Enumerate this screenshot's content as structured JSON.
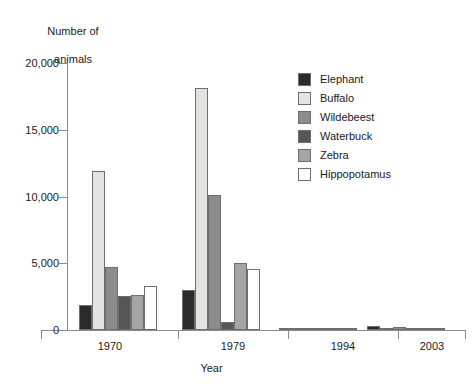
{
  "chart_data": {
    "type": "bar",
    "title": "",
    "ylabel": "Number of\nanimals",
    "xlabel": "Year",
    "categories": [
      "1970",
      "1979",
      "1994",
      "2003"
    ],
    "ylim": [
      0,
      20000
    ],
    "yticks": [
      0,
      5000,
      10000,
      15000,
      20000
    ],
    "ytick_labels": [
      "0",
      "5,000",
      "10,000",
      "15,000",
      "20,000"
    ],
    "grid": false,
    "legend_position": "right-top",
    "series": [
      {
        "name": "Elephant",
        "color": "#2b2b2b",
        "values": [
          1900,
          3000,
          120,
          280
        ]
      },
      {
        "name": "Buffalo",
        "color": "#e3e3e1",
        "values": [
          11900,
          18100,
          60,
          90
        ]
      },
      {
        "name": "Wildebeest",
        "color": "#8c8c8c",
        "values": [
          4700,
          10100,
          150,
          260
        ]
      },
      {
        "name": "Waterbuck",
        "color": "#565656",
        "values": [
          2550,
          620,
          40,
          110
        ]
      },
      {
        "name": "Zebra",
        "color": "#a5a5a5",
        "values": [
          2600,
          5000,
          80,
          180
        ]
      },
      {
        "name": "Hippopotamus",
        "color": "#ffffff",
        "values": [
          3300,
          4550,
          50,
          60
        ]
      }
    ]
  },
  "axis": {
    "y_title_line1": "Number of",
    "y_title_line2": "animals",
    "x_title": "Year"
  }
}
